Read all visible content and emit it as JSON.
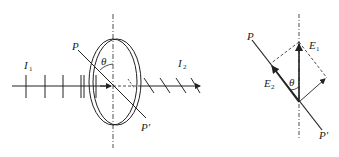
{
  "figure": {
    "left_panel": {
      "description": "Polarizer disk with transmission axis PP' at angle theta from vertical; incident light I1 passes through, emerging light I2",
      "labels": {
        "incident_intensity": "I",
        "incident_sub": "1",
        "transmitted_intensity": "I",
        "transmitted_sub": "2",
        "axis_start": "P",
        "axis_end": "P'",
        "angle": "θ"
      }
    },
    "right_panel": {
      "description": "Vector decomposition of electric field E1 into component E2 along PP' axis",
      "labels": {
        "field_in": "E",
        "field_in_sub": "1",
        "field_out": "E",
        "field_out_sub": "2",
        "axis_start": "P",
        "axis_end": "P'",
        "angle": "θ"
      }
    },
    "colors": {
      "stroke": "#222222",
      "background": "#ffffff"
    }
  }
}
